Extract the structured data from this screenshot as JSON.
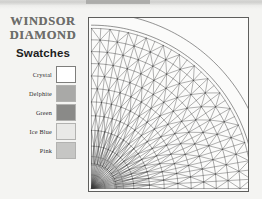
{
  "page": {
    "background_color": "#f4f4f2",
    "top_band": {
      "present": true,
      "description": "cropped-dark-text-band"
    }
  },
  "brand": {
    "line1": "WINDSOR",
    "line2": "DIAMOND",
    "color": "#6d6d6b"
  },
  "swatches_panel": {
    "title": "Swatches",
    "items": [
      {
        "label": "Crystal",
        "color": "#ffffff",
        "border": "#7e7e7c"
      },
      {
        "label": "Delphite",
        "color": "#a9a9a7",
        "border": "#b2b2b0"
      },
      {
        "label": "Green",
        "color": "#8a8a88",
        "border": "#b2b2b0"
      },
      {
        "label": "Ice Blue",
        "color": "#e9e9e7",
        "border": "#b2b2b0"
      },
      {
        "label": "Pink",
        "color": "#c6c6c4",
        "border": "#b2b2b0"
      }
    ]
  },
  "diagram": {
    "name": "quarter-dome-geodesic-mesh",
    "frame_color": "#5e5e5c",
    "line_color": "#3a3a3a",
    "origin": "bottom-left",
    "radial_count": 28,
    "arc_count": 11,
    "outer_arc_count": 2
  }
}
